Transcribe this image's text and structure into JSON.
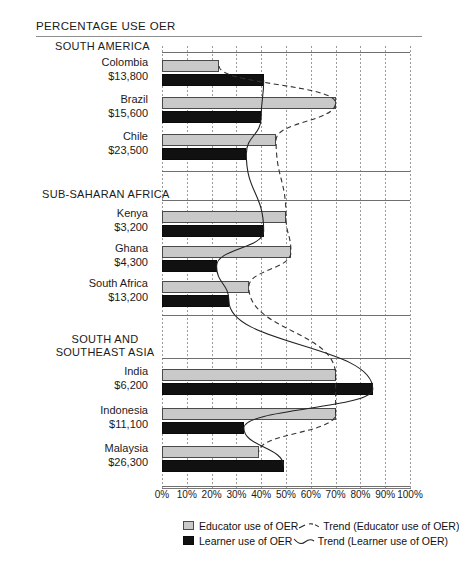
{
  "page": {
    "title": "PERCENTAGE USE OER"
  },
  "axis": {
    "ticks": [
      "0%",
      "10%",
      "20%",
      "30%",
      "40%",
      "50%",
      "60%",
      "70%",
      "80%",
      "90%",
      "100%"
    ],
    "min": 0,
    "max": 100
  },
  "legend": {
    "educator_swatch_label": "Educator use of OER",
    "learner_swatch_label": "Learner use of OER",
    "educator_trend_label": "Trend (Educator use of OER)",
    "learner_trend_label": "Trend (Learner use of OER)"
  },
  "colors": {
    "educator_bar": "#c9c9c9",
    "learner_bar": "#111111",
    "gridline": "#9a9a9a",
    "rule": "#6f6f6f"
  },
  "chart_data": {
    "type": "bar",
    "title": "PERCENTAGE USE OER",
    "xlabel": "",
    "ylabel": "",
    "xlim": [
      0,
      100
    ],
    "grid": true,
    "orientation": "horizontal",
    "legend_position": "bottom",
    "series": [
      {
        "name": "Educator use of OER",
        "color": "#c9c9c9",
        "values": [
          23,
          70,
          46,
          50,
          52,
          35,
          70,
          70,
          39
        ]
      },
      {
        "name": "Learner use of OER",
        "color": "#111111",
        "values": [
          41,
          40,
          34,
          41,
          22,
          27,
          85,
          33,
          49
        ]
      }
    ],
    "categories": [
      "Colombia",
      "Brazil",
      "Chile",
      "Kenya",
      "Ghana",
      "South Africa",
      "India",
      "Indonesia",
      "Malaysia"
    ],
    "groups": [
      {
        "region": "SOUTH AMERICA",
        "countries": [
          {
            "name": "Colombia",
            "gni": "$13,800",
            "educator": 23,
            "learner": 41
          },
          {
            "name": "Brazil",
            "gni": "$15,600",
            "educator": 70,
            "learner": 40
          },
          {
            "name": "Chile",
            "gni": "$23,500",
            "educator": 46,
            "learner": 34
          }
        ]
      },
      {
        "region": "SUB-SAHARAN AFRICA",
        "countries": [
          {
            "name": "Kenya",
            "gni": "$3,200",
            "educator": 50,
            "learner": 41
          },
          {
            "name": "Ghana",
            "gni": "$4,300",
            "educator": 52,
            "learner": 22
          },
          {
            "name": "South Africa",
            "gni": "$13,200",
            "educator": 35,
            "learner": 27
          }
        ]
      },
      {
        "region": "SOUTH AND\nSOUTHEAST ASIA",
        "region_line1": "SOUTH AND",
        "region_line2": "SOUTHEAST ASIA",
        "countries": [
          {
            "name": "India",
            "gni": "$6,200",
            "educator": 70,
            "learner": 85
          },
          {
            "name": "Indonesia",
            "gni": "$11,100",
            "educator": 70,
            "learner": 33
          },
          {
            "name": "Malaysia",
            "gni": "$26,300",
            "educator": 39,
            "learner": 49
          }
        ]
      }
    ],
    "trend_educator": {
      "label": "Trend (Educator use of OER)",
      "style": "dashed",
      "points": [
        [
          23,
          0
        ],
        [
          70,
          1
        ],
        [
          46,
          2
        ],
        [
          50,
          3
        ],
        [
          52,
          4
        ],
        [
          35,
          5
        ],
        [
          70,
          6
        ],
        [
          70,
          7
        ],
        [
          39,
          8
        ]
      ]
    },
    "trend_learner": {
      "label": "Trend (Learner use of OER)",
      "style": "solid",
      "points": [
        [
          41,
          0
        ],
        [
          40,
          1
        ],
        [
          34,
          2
        ],
        [
          41,
          3
        ],
        [
          22,
          4
        ],
        [
          27,
          5
        ],
        [
          85,
          6
        ],
        [
          33,
          7
        ],
        [
          49,
          8
        ]
      ]
    }
  }
}
